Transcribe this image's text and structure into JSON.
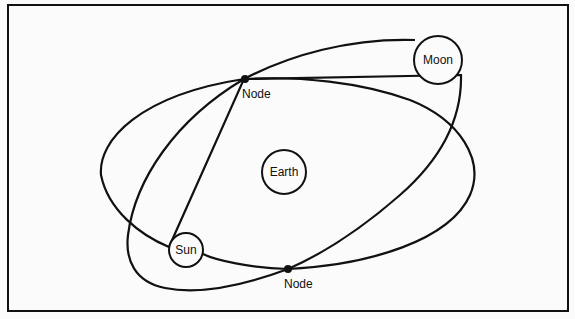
{
  "diagram": {
    "bodies": [
      {
        "id": "earth",
        "label": "Earth"
      },
      {
        "id": "moon",
        "label": "Moon"
      },
      {
        "id": "sun",
        "label": "Sun"
      }
    ],
    "nodes": [
      {
        "id": "node-upper",
        "label": "Node"
      },
      {
        "id": "node-lower",
        "label": "Node"
      }
    ],
    "orbits": [
      {
        "id": "sun-orbit"
      },
      {
        "id": "moon-orbit"
      }
    ]
  }
}
